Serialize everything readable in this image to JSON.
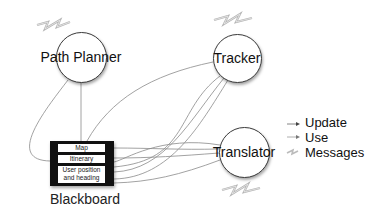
{
  "diagram": {
    "nodes": [
      {
        "id": "path_planner",
        "label": "Path Planner"
      },
      {
        "id": "tracker",
        "label": "Tracker"
      },
      {
        "id": "translator",
        "label": "Translator"
      }
    ],
    "blackboard": {
      "label": "Blackboard",
      "slots": [
        "Map",
        "Itinerary",
        "User position and heading"
      ],
      "slot_lines": [
        "Map",
        "Itinerary",
        "User position",
        "and heading"
      ]
    },
    "legend": {
      "items": [
        {
          "label": "Update",
          "icon": "arrow-solid-icon"
        },
        {
          "label": "Use",
          "icon": "arrow-thin-icon"
        },
        {
          "label": "Messages",
          "icon": "zigzag-message-icon"
        }
      ]
    },
    "colors": {
      "edge": "#8a8a8a",
      "node_border": "#3a3a3a",
      "blackboard_fill": "#111111",
      "message_icon": "#c8c8c8"
    }
  }
}
